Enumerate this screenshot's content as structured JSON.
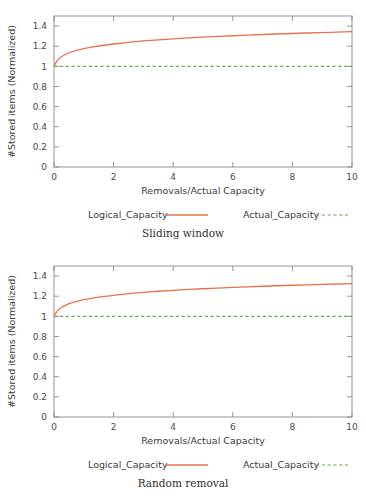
{
  "chart_data": [
    {
      "type": "line",
      "title": "",
      "caption": "Sliding window",
      "xlabel": "Removals/Actual Capacity",
      "ylabel": "#Stored items (Normalized)",
      "xlim": [
        0,
        10
      ],
      "ylim": [
        0,
        1.5
      ],
      "xticks": [
        0,
        2,
        4,
        6,
        8,
        10
      ],
      "xtick_labels": [
        "0",
        "2",
        "4",
        "6",
        "8",
        "10"
      ],
      "yticks": [
        0,
        0.2,
        0.4,
        0.6,
        0.8,
        1,
        1.2,
        1.4
      ],
      "ytick_labels": [
        "0",
        "0.2",
        "0.4",
        "0.6",
        "0.8",
        "1",
        "1.2",
        "1.4"
      ],
      "grid": false,
      "legend_position": "below",
      "series": [
        {
          "name": "Logical_Capacity",
          "style": "solid",
          "color": "#e8734a",
          "x": [
            0,
            0.1,
            0.2,
            0.3,
            0.5,
            0.75,
            1,
            1.25,
            1.5,
            2,
            2.5,
            3,
            3.5,
            4,
            4.5,
            5,
            5.5,
            6,
            6.5,
            7,
            7.5,
            8,
            8.5,
            9,
            9.5,
            10
          ],
          "values": [
            1.005,
            1.055,
            1.085,
            1.105,
            1.135,
            1.158,
            1.175,
            1.19,
            1.202,
            1.222,
            1.238,
            1.252,
            1.263,
            1.273,
            1.282,
            1.29,
            1.297,
            1.304,
            1.31,
            1.316,
            1.321,
            1.326,
            1.331,
            1.335,
            1.34,
            1.344
          ]
        },
        {
          "name": "Actual_Capacity",
          "style": "dashed",
          "color": "#6aa84f",
          "x": [
            0,
            10
          ],
          "values": [
            1,
            1
          ]
        }
      ]
    },
    {
      "type": "line",
      "title": "",
      "caption": "Random removal",
      "xlabel": "Removals/Actual Capacity",
      "ylabel": "#Stored items (Normalized)",
      "xlim": [
        0,
        10
      ],
      "ylim": [
        0,
        1.5
      ],
      "xticks": [
        0,
        2,
        4,
        6,
        8,
        10
      ],
      "xtick_labels": [
        "0",
        "2",
        "4",
        "6",
        "8",
        "10"
      ],
      "yticks": [
        0,
        0.2,
        0.4,
        0.6,
        0.8,
        1,
        1.2,
        1.4
      ],
      "ytick_labels": [
        "0",
        "0.2",
        "0.4",
        "0.6",
        "0.8",
        "1",
        "1.2",
        "1.4"
      ],
      "grid": false,
      "legend_position": "below",
      "series": [
        {
          "name": "Logical_Capacity",
          "style": "solid",
          "color": "#e8734a",
          "x": [
            0,
            0.1,
            0.2,
            0.3,
            0.5,
            0.75,
            1,
            1.25,
            1.5,
            2,
            2.5,
            3,
            3.5,
            4,
            4.5,
            5,
            5.5,
            6,
            6.5,
            7,
            7.5,
            8,
            8.5,
            9,
            9.5,
            10
          ],
          "values": [
            1.005,
            1.05,
            1.078,
            1.097,
            1.126,
            1.148,
            1.165,
            1.179,
            1.19,
            1.209,
            1.225,
            1.238,
            1.249,
            1.258,
            1.267,
            1.274,
            1.281,
            1.288,
            1.293,
            1.299,
            1.304,
            1.309,
            1.313,
            1.317,
            1.321,
            1.325
          ]
        },
        {
          "name": "Actual_Capacity",
          "style": "dashed",
          "color": "#6aa84f",
          "x": [
            0,
            10
          ],
          "values": [
            1,
            1
          ]
        }
      ]
    }
  ],
  "colors": {
    "logical": "#e8734a",
    "actual": "#6aa84f",
    "axis": "#8a8a8a",
    "text": "#3b3b3b",
    "background": "#ffffff"
  }
}
